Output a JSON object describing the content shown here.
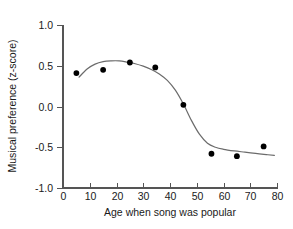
{
  "chart_data": {
    "type": "scatter",
    "title": "",
    "xlabel": "Age when song was popular",
    "ylabel": "Musical preference (z-score)",
    "xlim": [
      0,
      80
    ],
    "ylim": [
      -1.0,
      1.0
    ],
    "xticks": [
      "0",
      "10",
      "20",
      "30",
      "40",
      "50",
      "60",
      "70",
      "80"
    ],
    "xtick_values": [
      0,
      10,
      20,
      30,
      40,
      50,
      60,
      70,
      80
    ],
    "yticks": [
      "1.0",
      "0.5",
      "0.0",
      "-0.5",
      "-1.0"
    ],
    "ytick_values": [
      1.0,
      0.5,
      0.0,
      -0.5,
      -1.0
    ],
    "grid": false,
    "legend": null,
    "x": [
      5,
      15,
      25,
      34.5,
      45,
      55.5,
      65,
      75
    ],
    "y": [
      0.41,
      0.45,
      0.54,
      0.48,
      0.02,
      -0.58,
      -0.61,
      -0.49
    ],
    "points": [
      {
        "x": 5,
        "y": 0.41
      },
      {
        "x": 15,
        "y": 0.45
      },
      {
        "x": 25,
        "y": 0.54
      },
      {
        "x": 34.5,
        "y": 0.48
      },
      {
        "x": 45,
        "y": 0.02
      },
      {
        "x": 55.5,
        "y": -0.58
      },
      {
        "x": 65,
        "y": -0.61
      },
      {
        "x": 75,
        "y": -0.49
      }
    ],
    "series": [
      {
        "name": "observed",
        "type": "scatter",
        "marker": "filled-circle",
        "color": "#000000",
        "values": [
          0.41,
          0.45,
          0.54,
          0.48,
          0.02,
          -0.58,
          -0.61,
          -0.49
        ]
      },
      {
        "name": "fitted-curve",
        "type": "line",
        "color": "#6b6b6b",
        "x": [
          6,
          9,
          12,
          15,
          18,
          21,
          24,
          27,
          30,
          33,
          36,
          39,
          42,
          45,
          48,
          51,
          54,
          57,
          60,
          64,
          68,
          72,
          76,
          79
        ],
        "values": [
          0.36,
          0.46,
          0.52,
          0.55,
          0.56,
          0.56,
          0.545,
          0.525,
          0.495,
          0.455,
          0.4,
          0.32,
          0.2,
          0.03,
          -0.17,
          -0.34,
          -0.45,
          -0.5,
          -0.525,
          -0.545,
          -0.56,
          -0.575,
          -0.59,
          -0.6
        ]
      }
    ]
  },
  "axis": {
    "xlabel": "Age when song was popular",
    "ylabel": "Musical preference (z-score)"
  }
}
